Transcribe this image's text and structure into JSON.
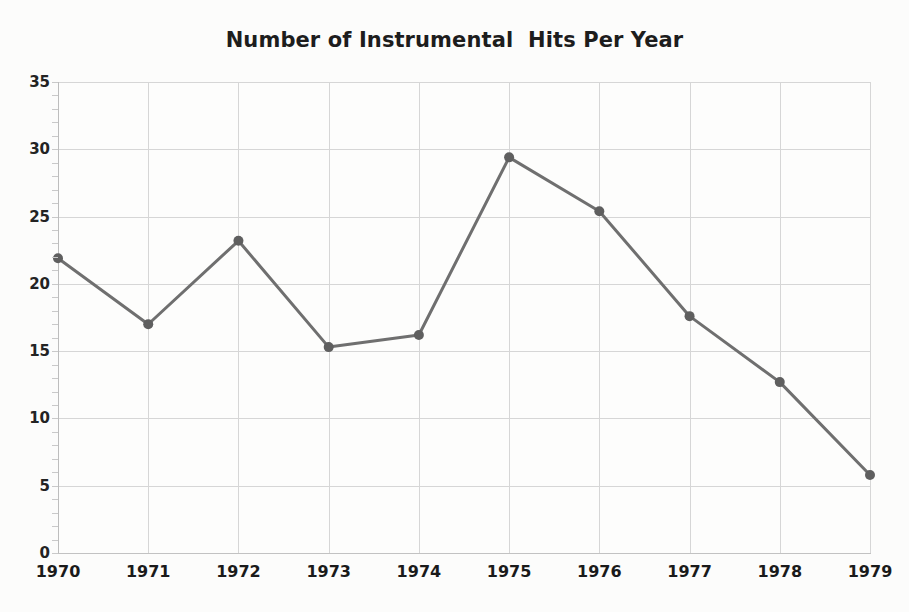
{
  "chart_data": {
    "type": "line",
    "title": "Number of Instrumental  Hits Per Year",
    "xlabel": "",
    "ylabel": "",
    "categories": [
      "1970",
      "1971",
      "1972",
      "1973",
      "1974",
      "1975",
      "1976",
      "1977",
      "1978",
      "1979"
    ],
    "values": [
      21.9,
      17.0,
      23.2,
      15.3,
      16.2,
      29.4,
      25.4,
      17.6,
      12.7,
      5.8
    ],
    "series": [
      {
        "name": "Instrumental hits",
        "values": [
          21.9,
          17.0,
          23.2,
          15.3,
          16.2,
          29.4,
          25.4,
          17.6,
          12.7,
          5.8
        ]
      }
    ],
    "x_tick_labels": [
      "1970",
      "1971",
      "1972",
      "1973",
      "1974",
      "1975",
      "1976",
      "1977",
      "1978",
      "1979"
    ],
    "y_tick_labels": [
      "0",
      "5",
      "10",
      "15",
      "20",
      "25",
      "30",
      "35"
    ],
    "y_ticks": [
      0,
      5,
      10,
      15,
      20,
      25,
      30,
      35
    ],
    "ylim": [
      0,
      35
    ],
    "grid": true,
    "legend": false,
    "legend_position": "none",
    "markers": "circle",
    "colors": {
      "line": "#6f6f6f",
      "marker": "#5f5f5f",
      "grid": "#d6d6d6",
      "axis": "#bdbdbd",
      "text": "#1d1d1d",
      "background": "#fcfcfb"
    }
  },
  "figure": {
    "title": "Number of Instrumental  Hits Per Year"
  }
}
